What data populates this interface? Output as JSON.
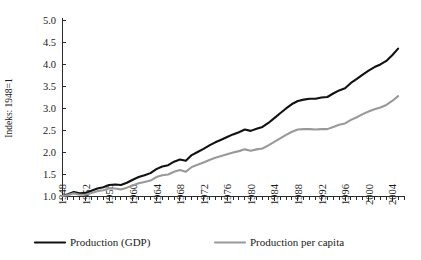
{
  "chart_data": {
    "type": "line",
    "title": "",
    "xlabel": "",
    "ylabel": "Indeks: 1948=1",
    "ylim": [
      1.0,
      5.0
    ],
    "xlim": [
      1948,
      2006
    ],
    "grid": false,
    "legend_position": "bottom",
    "ytick_labels": [
      "1.0",
      "1.5",
      "2.0",
      "2.5",
      "3.0",
      "3.5",
      "4.0",
      "4.5",
      "5.0"
    ],
    "ytick_values": [
      1.0,
      1.5,
      2.0,
      2.5,
      3.0,
      3.5,
      4.0,
      4.5,
      5.0
    ],
    "xtick_labels": [
      "1948",
      "1952",
      "1956",
      "1960",
      "1964",
      "1968",
      "1972",
      "1976",
      "1980",
      "1984",
      "1988",
      "1992",
      "1996",
      "2000",
      "2004"
    ],
    "xtick_values": [
      1948,
      1952,
      1956,
      1960,
      1964,
      1968,
      1972,
      1976,
      1980,
      1984,
      1988,
      1992,
      1996,
      2000,
      2004
    ],
    "minor_tick_interval": 1,
    "x": [
      1948,
      1949,
      1950,
      1951,
      1952,
      1953,
      1954,
      1955,
      1956,
      1957,
      1958,
      1959,
      1960,
      1961,
      1962,
      1963,
      1964,
      1965,
      1966,
      1967,
      1968,
      1969,
      1970,
      1971,
      1972,
      1973,
      1974,
      1975,
      1976,
      1977,
      1978,
      1979,
      1980,
      1981,
      1982,
      1983,
      1984,
      1985,
      1986,
      1987,
      1988,
      1989,
      1990,
      1991,
      1992,
      1993,
      1994,
      1995,
      1996,
      1997,
      1998,
      1999,
      2000,
      2001,
      2002,
      2003,
      2004,
      2005
    ],
    "series": [
      {
        "name": "Production (GDP)",
        "color": "#111111",
        "width": 2.1,
        "values": [
          1.0,
          1.04,
          1.09,
          1.06,
          1.07,
          1.12,
          1.17,
          1.2,
          1.25,
          1.26,
          1.25,
          1.3,
          1.37,
          1.43,
          1.47,
          1.52,
          1.61,
          1.67,
          1.7,
          1.78,
          1.83,
          1.8,
          1.93,
          2.0,
          2.07,
          2.15,
          2.22,
          2.28,
          2.34,
          2.4,
          2.45,
          2.51,
          2.48,
          2.53,
          2.57,
          2.66,
          2.77,
          2.88,
          2.99,
          3.09,
          3.16,
          3.19,
          3.21,
          3.21,
          3.24,
          3.25,
          3.33,
          3.4,
          3.45,
          3.57,
          3.66,
          3.76,
          3.85,
          3.93,
          3.99,
          4.07,
          4.2,
          4.35
        ]
      },
      {
        "name": "Production per capita",
        "color": "#999999",
        "width": 2.1,
        "values": [
          1.0,
          1.02,
          1.06,
          1.03,
          1.03,
          1.07,
          1.11,
          1.13,
          1.17,
          1.17,
          1.15,
          1.19,
          1.24,
          1.29,
          1.32,
          1.35,
          1.43,
          1.47,
          1.49,
          1.55,
          1.59,
          1.55,
          1.66,
          1.71,
          1.76,
          1.82,
          1.87,
          1.91,
          1.95,
          1.99,
          2.02,
          2.06,
          2.03,
          2.06,
          2.08,
          2.15,
          2.23,
          2.31,
          2.39,
          2.46,
          2.51,
          2.52,
          2.52,
          2.51,
          2.52,
          2.52,
          2.57,
          2.62,
          2.65,
          2.73,
          2.79,
          2.86,
          2.92,
          2.97,
          3.01,
          3.07,
          3.16,
          3.27
        ]
      }
    ]
  },
  "legend": {
    "items": [
      {
        "label": "Production (GDP)",
        "color": "#111111"
      },
      {
        "label": "Production per capita",
        "color": "#999999"
      }
    ]
  },
  "axis": {
    "y_title": "Indeks: 1948=1"
  }
}
